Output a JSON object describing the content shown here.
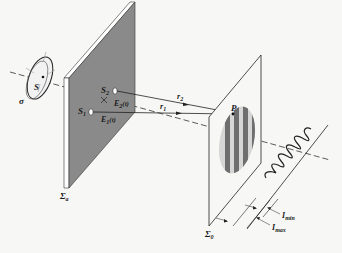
{
  "figure": {
    "labels": {
      "source": "S",
      "source_region": "σ",
      "slit_1": "S",
      "slit_1_sub": "1",
      "slit_2": "S",
      "slit_2_sub": "2",
      "field_1": "E",
      "field_1_sub": "1",
      "field_1_arg": "(t)",
      "field_2": "E",
      "field_2_sub": "2",
      "field_2_arg": "(t)",
      "path_1": "r",
      "path_1_sub": "1",
      "path_2": "r",
      "path_2_sub": "2",
      "point": "P",
      "aperture_screen": "Σ",
      "aperture_screen_sub": "a",
      "observation_screen": "Σ",
      "observation_screen_sub": "0",
      "i_min": "I",
      "i_min_sub": "min",
      "i_max": "I",
      "i_max_sub": "max"
    },
    "colors": {
      "screen_fill": "#8a8a8a",
      "screen_edge": "#ffffff",
      "line": "#1a1a1a",
      "fringe_dark": "#6e6e6e",
      "fringe_light": "#d6d6d6",
      "background": "#f7f7f5"
    }
  }
}
